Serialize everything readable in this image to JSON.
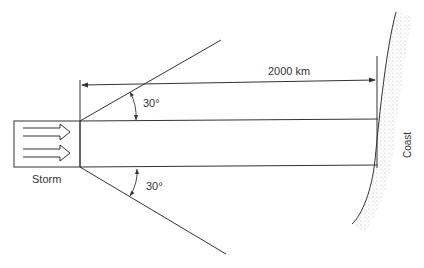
{
  "diagram": {
    "storm_label": "Storm",
    "distance_label": "2000 km",
    "angle_top_label": "30°",
    "angle_bottom_label": "30°",
    "coast_label": "Coast",
    "colors": {
      "line": "#333333",
      "stipple": "#9a9a9a",
      "background": "#ffffff"
    }
  }
}
